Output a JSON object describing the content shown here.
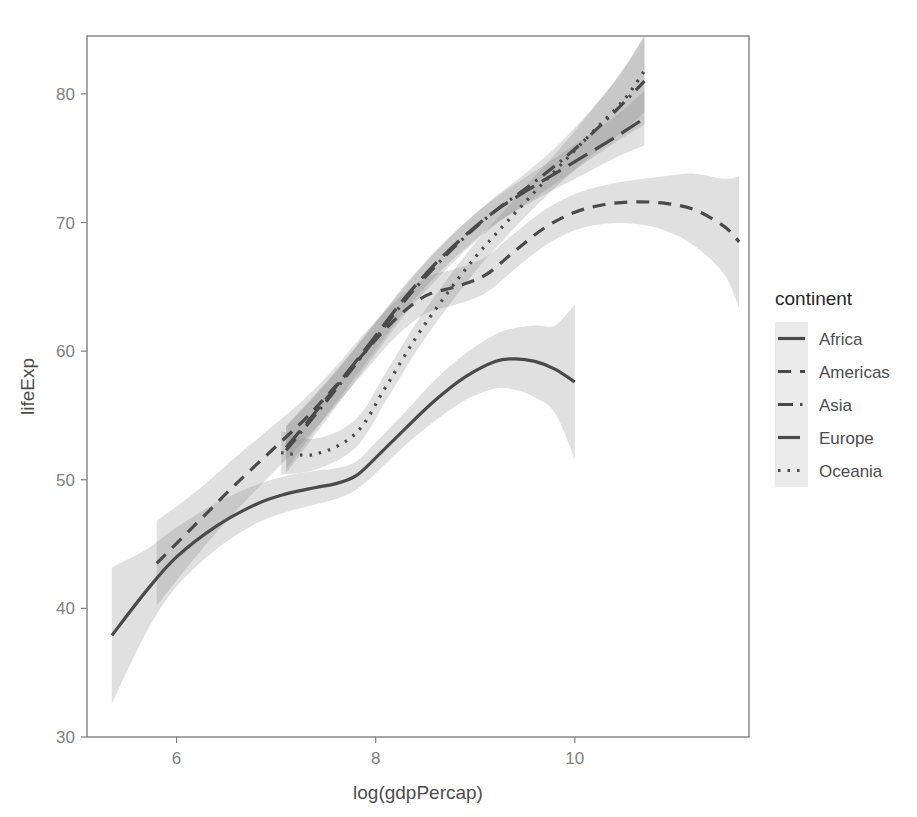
{
  "chart_data": {
    "type": "line",
    "title": "",
    "xlabel": "log(gdpPercap)",
    "ylabel": "lifeExp",
    "xlim": [
      5.1,
      11.75
    ],
    "ylim": [
      30,
      84.5
    ],
    "xticks": [
      6,
      8,
      10
    ],
    "yticks": [
      30,
      40,
      50,
      60,
      70,
      80
    ],
    "grid": false,
    "legend": {
      "title": "continent",
      "position": "right",
      "entries": [
        {
          "label": "Africa",
          "linetype": "solid"
        },
        {
          "label": "Americas",
          "linetype": "dashed"
        },
        {
          "label": "Asia",
          "linetype": "dashdot"
        },
        {
          "label": "Europe",
          "linetype": "longdash"
        },
        {
          "label": "Oceania",
          "linetype": "dotted"
        }
      ]
    },
    "series": [
      {
        "name": "Africa",
        "linetype": "solid",
        "x": [
          5.35,
          5.7,
          6.0,
          6.4,
          6.8,
          7.1,
          7.4,
          7.6,
          7.8,
          8.0,
          8.3,
          8.6,
          8.9,
          9.2,
          9.4,
          9.6,
          9.8,
          10.0
        ],
        "y": [
          37.9,
          41.4,
          44.0,
          46.4,
          48.1,
          48.9,
          49.4,
          49.7,
          50.3,
          51.7,
          54.0,
          56.2,
          58.0,
          59.2,
          59.4,
          59.2,
          58.6,
          57.6
        ],
        "ci_lower": [
          32.6,
          38.2,
          41.7,
          44.6,
          46.6,
          47.5,
          48.1,
          48.5,
          49.2,
          50.5,
          52.7,
          54.6,
          56.2,
          57.1,
          57.0,
          56.4,
          55.2,
          51.6
        ],
        "ci_upper": [
          43.2,
          44.6,
          46.3,
          48.2,
          49.6,
          50.3,
          50.7,
          50.9,
          51.4,
          52.9,
          55.3,
          57.8,
          59.8,
          61.3,
          61.8,
          62.0,
          62.0,
          63.6
        ]
      },
      {
        "name": "Americas",
        "linetype": "dashed",
        "x": [
          5.8,
          6.2,
          6.6,
          7.0,
          7.3,
          7.6,
          7.9,
          8.2,
          8.5,
          8.8,
          9.1,
          9.4,
          9.7,
          10.0,
          10.3,
          10.6,
          10.9,
          11.2,
          11.5,
          11.65
        ],
        "y": [
          43.5,
          46.6,
          49.7,
          52.6,
          54.8,
          57.3,
          60.0,
          62.5,
          64.3,
          65.0,
          65.9,
          67.8,
          69.6,
          70.8,
          71.4,
          71.6,
          71.5,
          71.0,
          69.7,
          68.5
        ],
        "ci_lower": [
          40.2,
          44.1,
          47.6,
          50.8,
          53.2,
          55.8,
          58.5,
          61.1,
          62.9,
          63.6,
          64.5,
          66.4,
          68.2,
          69.4,
          69.9,
          69.9,
          69.4,
          68.2,
          66.0,
          63.4
        ],
        "ci_upper": [
          46.8,
          49.1,
          51.8,
          54.4,
          56.4,
          58.8,
          61.5,
          63.9,
          65.7,
          66.4,
          67.3,
          69.2,
          71.0,
          72.2,
          72.9,
          73.3,
          73.6,
          73.8,
          73.4,
          73.6
        ]
      },
      {
        "name": "Asia",
        "linetype": "dashdot",
        "x": [
          7.1,
          7.4,
          7.7,
          8.0,
          8.3,
          8.6,
          8.9,
          9.2,
          9.5,
          9.8,
          10.1,
          10.4,
          10.7
        ],
        "y": [
          52.3,
          55.1,
          58.0,
          61.0,
          64.0,
          66.6,
          68.9,
          70.9,
          72.6,
          74.4,
          76.4,
          78.6,
          81.0
        ],
        "ci_lower": [
          50.5,
          53.6,
          56.7,
          59.8,
          62.9,
          65.5,
          67.8,
          69.8,
          71.4,
          73.0,
          74.6,
          76.2,
          77.6
        ],
        "ci_upper": [
          54.1,
          56.6,
          59.3,
          62.2,
          65.1,
          67.7,
          70.0,
          72.0,
          73.8,
          75.8,
          78.2,
          81.0,
          84.4
        ]
      },
      {
        "name": "Europe",
        "linetype": "longdash",
        "x": [
          7.1,
          7.4,
          7.7,
          8.0,
          8.3,
          8.6,
          8.9,
          9.2,
          9.5,
          9.8,
          10.1,
          10.4,
          10.7
        ],
        "y": [
          52.5,
          55.3,
          58.2,
          61.2,
          64.2,
          66.8,
          69.0,
          70.9,
          72.4,
          73.8,
          75.2,
          76.6,
          78.1
        ],
        "ci_lower": [
          50.8,
          53.9,
          57.0,
          60.1,
          63.2,
          65.8,
          68.0,
          69.9,
          71.3,
          72.6,
          73.8,
          75.0,
          76.0
        ],
        "ci_upper": [
          54.2,
          56.7,
          59.4,
          62.3,
          65.2,
          67.8,
          70.0,
          71.9,
          73.5,
          75.0,
          76.6,
          78.2,
          80.2
        ]
      },
      {
        "name": "Oceania",
        "linetype": "dotted",
        "x": [
          7.05,
          7.4,
          7.8,
          8.1,
          8.4,
          8.7,
          9.0,
          9.3,
          9.6,
          9.9,
          10.2,
          10.5,
          10.7
        ],
        "y": [
          52.1,
          52.0,
          53.6,
          57.2,
          61.0,
          64.3,
          67.3,
          69.9,
          72.4,
          74.8,
          77.2,
          79.6,
          81.8
        ],
        "ci_lower": [
          50.4,
          50.8,
          52.5,
          56.1,
          59.9,
          63.2,
          66.2,
          68.8,
          71.2,
          73.4,
          75.4,
          77.2,
          78.6
        ],
        "ci_upper": [
          53.8,
          53.2,
          54.7,
          58.3,
          62.1,
          65.4,
          68.4,
          71.0,
          73.6,
          76.2,
          79.0,
          82.0,
          84.6
        ]
      }
    ]
  },
  "colors": {
    "line": "#4a4a4a",
    "ribbon": "#7f7f7f",
    "panel_border": "#6b6b6b",
    "tick_label": "#7f7f7f",
    "axis_title": "#4d4d4d",
    "legend_key_bg": "#ebebeb",
    "background": "#ffffff"
  }
}
